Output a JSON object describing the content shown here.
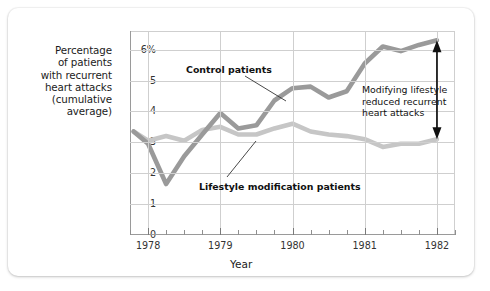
{
  "chart_data": {
    "type": "line",
    "title": "",
    "subtitle": "",
    "xlabel": "Year",
    "ylabel": "Percentage of patients with recurrent heart attacks (cumulative average)",
    "ylabel_lines": [
      "Percentage",
      "of patients",
      "with recurrent",
      "heart attacks",
      "(cumulative",
      "average)"
    ],
    "xlim": [
      1977.75,
      1982.25
    ],
    "ylim": [
      0,
      6.6
    ],
    "grid": true,
    "legend_position": "inline-annotations",
    "y_ticks": [
      0,
      1,
      2,
      3,
      4,
      5,
      6
    ],
    "y_tick_labels": [
      "0",
      "1",
      "2",
      "3",
      "4",
      "5",
      "6%"
    ],
    "x_ticks": [
      1978,
      1979,
      1980,
      1981,
      1982
    ],
    "x_tick_labels": [
      "1978",
      "1979",
      "1980",
      "1981",
      "1982"
    ],
    "x_minor_tick_interval": 0.25,
    "series": [
      {
        "name": "Control patients",
        "color": "#9a9a9a",
        "x": [
          1977.8,
          1978.0,
          1978.25,
          1978.5,
          1978.75,
          1979.0,
          1979.25,
          1979.5,
          1979.75,
          1980.0,
          1980.25,
          1980.5,
          1980.75,
          1981.0,
          1981.25,
          1981.5,
          1981.75,
          1982.0
        ],
        "values": [
          3.35,
          2.95,
          1.65,
          2.55,
          3.25,
          3.95,
          3.45,
          3.55,
          4.35,
          4.75,
          4.8,
          4.45,
          4.65,
          5.55,
          6.1,
          5.95,
          6.15,
          6.3
        ]
      },
      {
        "name": "Lifestyle modification patients",
        "color": "#c6c6c6",
        "x": [
          1977.8,
          1978.0,
          1978.25,
          1978.5,
          1978.75,
          1979.0,
          1979.25,
          1979.5,
          1979.75,
          1980.0,
          1980.25,
          1980.5,
          1980.75,
          1981.0,
          1981.25,
          1981.5,
          1981.75,
          1982.0
        ],
        "values": [
          3.35,
          3.05,
          3.2,
          3.05,
          3.4,
          3.5,
          3.25,
          3.25,
          3.45,
          3.6,
          3.35,
          3.25,
          3.2,
          3.1,
          2.85,
          2.95,
          2.95,
          3.1
        ]
      }
    ],
    "annotations": [
      {
        "name": "control-patients",
        "text": "Control patients",
        "points_to_series": "Control patients"
      },
      {
        "name": "lifestyle-modification-patients",
        "text": "Lifestyle modification patients",
        "points_to_series": "Lifestyle modification patients"
      },
      {
        "name": "gap-callout",
        "text": "Modifying lifestyle reduced recurrent heart attacks",
        "text_lines": [
          "Modifying lifestyle",
          "reduced recurrent",
          "heart attacks"
        ]
      }
    ],
    "arrow": {
      "name": "difference-arrow",
      "type": "double-headed-vertical",
      "at_x": 1982.0,
      "from_y": 3.1,
      "to_y": 6.3
    }
  },
  "colors": {
    "control_line": "#9a9a9a",
    "lifestyle_line": "#c6c6c6",
    "grid": "#cfcfcf",
    "axis": "#9a9a9a",
    "text": "#1b1b1b",
    "card_background": "#ffffff"
  }
}
